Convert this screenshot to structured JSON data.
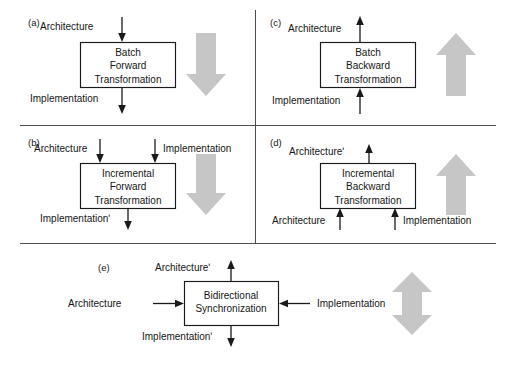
{
  "figure": {
    "background_color": "#ffffff",
    "line_color": "#1a1a1a",
    "divider_color": "#4d4d4d",
    "block_arrow_color": "#c6c6c6",
    "panels": [
      {
        "id": "a",
        "label": "(a)",
        "box_lines": [
          "Batch",
          "Forward",
          "Transformation"
        ],
        "inputs": [
          {
            "label": "Architecture",
            "direction": "down"
          }
        ],
        "outputs": [
          {
            "label": "Implementation",
            "direction": "down"
          }
        ],
        "block_arrow": "arrow-down"
      },
      {
        "id": "b",
        "label": "(b)",
        "box_lines": [
          "Incremental",
          "Forward",
          "Transformation"
        ],
        "inputs": [
          {
            "label": "Architecture",
            "direction": "down"
          },
          {
            "label": "Implementation",
            "direction": "down"
          }
        ],
        "outputs": [
          {
            "label": "Implementationʹ",
            "direction": "down"
          }
        ],
        "block_arrow": "arrow-down"
      },
      {
        "id": "c",
        "label": "(c)",
        "box_lines": [
          "Batch",
          "Backward",
          "Transformation"
        ],
        "inputs": [
          {
            "label": "Implementation",
            "direction": "up"
          }
        ],
        "outputs": [
          {
            "label": "Architecture",
            "direction": "up"
          }
        ],
        "block_arrow": "arrow-up"
      },
      {
        "id": "d",
        "label": "(d)",
        "box_lines": [
          "Incremental",
          "Backward",
          "Transformation"
        ],
        "inputs": [
          {
            "label": "Architecture",
            "direction": "up"
          },
          {
            "label": "Implementation",
            "direction": "up"
          }
        ],
        "outputs": [
          {
            "label": "Architectureʹ",
            "direction": "up"
          }
        ],
        "block_arrow": "arrow-up"
      },
      {
        "id": "e",
        "label": "(e)",
        "box_lines": [
          "Bidirectional",
          "Synchronization"
        ],
        "inputs": [
          {
            "label": "Architecture",
            "direction": "right"
          },
          {
            "label": "Implementation",
            "direction": "left"
          }
        ],
        "outputs": [
          {
            "label": "Architectureʹ",
            "direction": "up"
          },
          {
            "label": "Implementationʹ",
            "direction": "down"
          }
        ],
        "block_arrow": "arrow-up-down"
      }
    ]
  }
}
